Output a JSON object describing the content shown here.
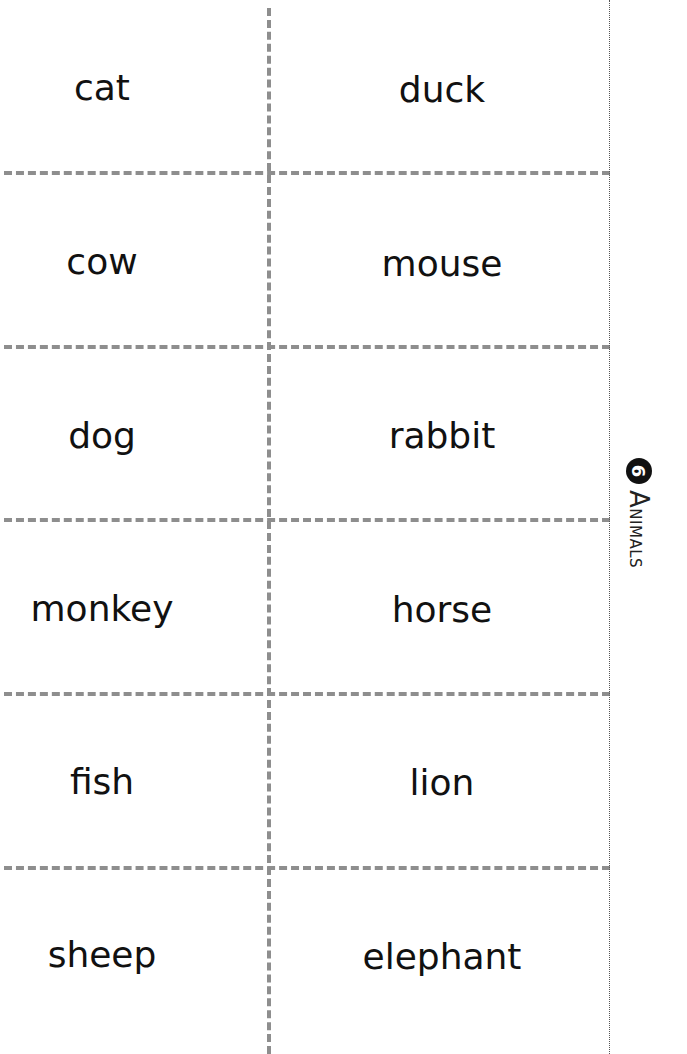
{
  "section": {
    "number": "6",
    "title": "Animals",
    "title_first": "A",
    "title_rest": "nimals"
  },
  "cards": {
    "rows": [
      {
        "left": "cat",
        "right": "duck"
      },
      {
        "left": "cow",
        "right": "mouse"
      },
      {
        "left": "dog",
        "right": "rabbit"
      },
      {
        "left": "monkey",
        "right": "horse"
      },
      {
        "left": "fish",
        "right": "lion"
      },
      {
        "left": "sheep",
        "right": "elephant"
      }
    ]
  },
  "colors": {
    "cut_line": "#8e8e8e",
    "fold_line": "#555555",
    "text": "#111111"
  }
}
